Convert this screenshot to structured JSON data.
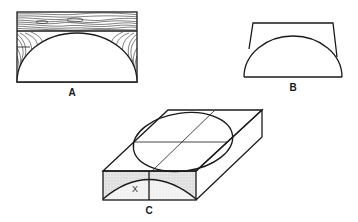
{
  "figure": {
    "background": "#ffffff",
    "ink": "#1a1a1a",
    "shade": "#e2e2e2",
    "panels": [
      {
        "id": "A",
        "label": "A",
        "description": "Rectangular wood block with grain hatching, semicircular cutout along bottom edge"
      },
      {
        "id": "B",
        "label": "B",
        "description": "Trapezoid profile with semicircular arc inside"
      },
      {
        "id": "C",
        "label": "C",
        "description": "Isometric slab with ellipse on top face and shaded front section with arc",
        "inner_label": "X"
      }
    ]
  }
}
